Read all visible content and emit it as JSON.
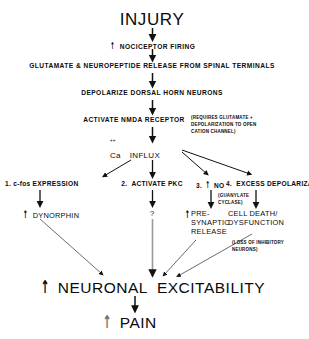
{
  "diagram": {
    "title": "INJURY",
    "up_arrow_glyph": "↑",
    "nodes": {
      "injury": "INJURY",
      "nociceptor_firing": "NOCICEPTOR FIRING",
      "glutamate_release": "GLUTAMATE & NEUROPEPTIDE RELEASE FROM SPINAL TERMINALS",
      "depolarize": "DEPOLARIZE DORSAL HORN NEURONS",
      "activate_nmda": "ACTIVATE NMDA RECEPTOR",
      "nmda_note": "(REQUIRES GLUTAMATE +\nDEPOLARIZATION TO OPEN\nCATION CHANNEL)",
      "ca_label": "Ca",
      "ca_charge": "++",
      "influx_label": "INFLUX",
      "branch_1": "1. c-fos EXPRESSION",
      "branch_2": "2.  ACTIVATE PKC",
      "branch_3_num": "3.",
      "branch_3": "NO",
      "branch_4": "4.  EXCESS DEPOLARIZATION",
      "dynorphin": "DYNORPHIN",
      "question": "?",
      "presynaptic_release": "PRE-\nSYNAPTIC\nRELEASE",
      "guanylate_note": "(GUANYLATE\nCYCLASE)",
      "cell_death": "CELL DEATH/\nDYSFUNCTION",
      "loss_note": "(LOSS OF INHIBITORY\nNEURONS)",
      "neuronal_excitability": "NEURONAL  EXCITABILITY",
      "pain": "PAIN"
    }
  },
  "colors": {
    "ink": "#0a0a0a",
    "background": "#ffffff",
    "edge": "#1a1a1a",
    "edge_gray": "#8a8a8a"
  }
}
